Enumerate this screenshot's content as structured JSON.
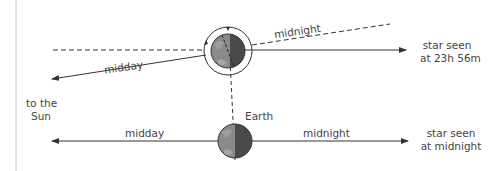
{
  "diagram": {
    "colors": {
      "line": "#333333",
      "earth_day": "#8a8a8a",
      "earth_night": "#4a4a4a",
      "border": "#c8c8c8",
      "text": "#444444"
    },
    "top": {
      "midday_label": "midday",
      "midnight_label": "midnight",
      "star_label_line1": "star seen",
      "star_label_line2": "at 23h 56m"
    },
    "sun": {
      "line1": "to the",
      "line2": "Sun"
    },
    "bottom": {
      "earth_label": "Earth",
      "midday_label": "midday",
      "midnight_label": "midnight",
      "star_label_line1": "star seen",
      "star_label_line2": "at midnight"
    }
  }
}
